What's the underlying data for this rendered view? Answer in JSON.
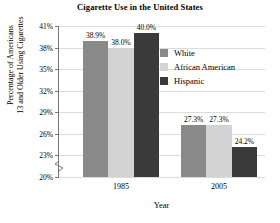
{
  "chart_data": {
    "type": "bar",
    "title": "Cigarette Use in the United States",
    "xlabel": "Year",
    "ylabel_lines": [
      "Percentage of Americans",
      "13 and Older Using Cigarettes"
    ],
    "categories": [
      "1985",
      "2005"
    ],
    "series": [
      {
        "name": "White",
        "values": [
          38.9,
          27.3
        ],
        "labels": [
          "38.9%",
          "27.3%"
        ],
        "color": "#8a8a8a"
      },
      {
        "name": "African American",
        "values": [
          38.0,
          27.3
        ],
        "labels": [
          "38.0%",
          "27.3%"
        ],
        "color": "#d3d3d3"
      },
      {
        "name": "Hispanic",
        "values": [
          40.0,
          24.2
        ],
        "labels": [
          "40.0%",
          "24.2%"
        ],
        "color": "#3a3a3a"
      }
    ],
    "ylim": [
      20,
      41
    ],
    "yticks": [
      41,
      38,
      35,
      32,
      29,
      26,
      23,
      20
    ],
    "ytick_labels": [
      "41%",
      "38%",
      "35%",
      "32%",
      "29%",
      "26%",
      "23%",
      "20%"
    ],
    "grid": true,
    "axis_break": true,
    "legend_position": "upper-right-inside"
  },
  "legend": {
    "items": [
      {
        "label": "White",
        "color": "#8a8a8a"
      },
      {
        "label": "African American",
        "color": "#d3d3d3"
      },
      {
        "label": "Hispanic",
        "color": "#3a3a3a"
      }
    ]
  },
  "colors": {
    "axis": "#777777",
    "grid": "#dcdcdc",
    "background": "#ffffff",
    "text": "#000000"
  }
}
